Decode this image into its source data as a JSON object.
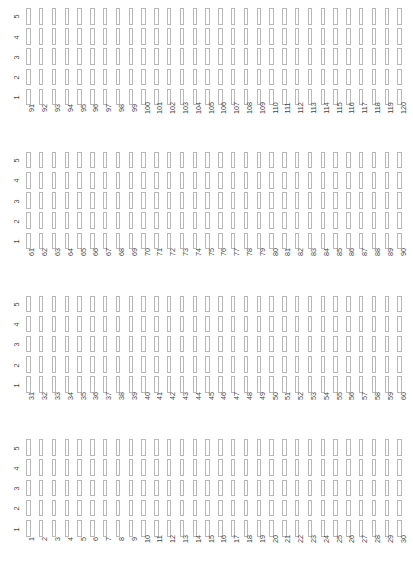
{
  "figure": {
    "type": "grid-matrix-panels",
    "background": "#ffffff",
    "cell_border_color": "#b8b8b8",
    "cell_fill_color": "#ffffff",
    "tick_label_color": "#444444",
    "panel_count": 4,
    "rows_per_panel": 5,
    "columns_per_panel": 30
  },
  "chart_data": {
    "type": "heatmap",
    "title": "",
    "xlabel": "",
    "ylabel": "",
    "grid": false,
    "legend": "none",
    "ylim": [
      1,
      5
    ],
    "y_categories": [
      "5",
      "4",
      "3",
      "2",
      "1"
    ],
    "panels": [
      {
        "index": 0,
        "y_ticks": [
          "5",
          "4",
          "3",
          "2",
          "1"
        ],
        "x_ticks": [
          "91",
          "92",
          "93",
          "94",
          "95",
          "96",
          "97",
          "98",
          "99",
          "100",
          "101",
          "102",
          "103",
          "104",
          "105",
          "106",
          "107",
          "108",
          "109",
          "110",
          "111",
          "112",
          "113",
          "114",
          "115",
          "116",
          "117",
          "118",
          "119",
          "120"
        ],
        "xlim": [
          91,
          120
        ],
        "values": [
          [
            0,
            0,
            0,
            0,
            0,
            0,
            0,
            0,
            0,
            0,
            0,
            0,
            0,
            0,
            0,
            0,
            0,
            0,
            0,
            0,
            0,
            0,
            0,
            0,
            0,
            0,
            0,
            0,
            0,
            0
          ],
          [
            0,
            0,
            0,
            0,
            0,
            0,
            0,
            0,
            0,
            0,
            0,
            0,
            0,
            0,
            0,
            0,
            0,
            0,
            0,
            0,
            0,
            0,
            0,
            0,
            0,
            0,
            0,
            0,
            0,
            0
          ],
          [
            0,
            0,
            0,
            0,
            0,
            0,
            0,
            0,
            0,
            0,
            0,
            0,
            0,
            0,
            0,
            0,
            0,
            0,
            0,
            0,
            0,
            0,
            0,
            0,
            0,
            0,
            0,
            0,
            0,
            0
          ],
          [
            0,
            0,
            0,
            0,
            0,
            0,
            0,
            0,
            0,
            0,
            0,
            0,
            0,
            0,
            0,
            0,
            0,
            0,
            0,
            0,
            0,
            0,
            0,
            0,
            0,
            0,
            0,
            0,
            0,
            0
          ],
          [
            0,
            0,
            0,
            0,
            0,
            0,
            0,
            0,
            0,
            0,
            0,
            0,
            0,
            0,
            0,
            0,
            0,
            0,
            0,
            0,
            0,
            0,
            0,
            0,
            0,
            0,
            0,
            0,
            0,
            0
          ]
        ]
      },
      {
        "index": 1,
        "y_ticks": [
          "5",
          "4",
          "3",
          "2",
          "1"
        ],
        "x_ticks": [
          "61",
          "62",
          "63",
          "64",
          "65",
          "66",
          "67",
          "68",
          "69",
          "70",
          "71",
          "72",
          "73",
          "74",
          "75",
          "76",
          "77",
          "78",
          "79",
          "80",
          "81",
          "82",
          "83",
          "84",
          "85",
          "86",
          "87",
          "88",
          "89",
          "90"
        ],
        "xlim": [
          61,
          90
        ],
        "values": [
          [
            0,
            0,
            0,
            0,
            0,
            0,
            0,
            0,
            0,
            0,
            0,
            0,
            0,
            0,
            0,
            0,
            0,
            0,
            0,
            0,
            0,
            0,
            0,
            0,
            0,
            0,
            0,
            0,
            0,
            0
          ],
          [
            0,
            0,
            0,
            0,
            0,
            0,
            0,
            0,
            0,
            0,
            0,
            0,
            0,
            0,
            0,
            0,
            0,
            0,
            0,
            0,
            0,
            0,
            0,
            0,
            0,
            0,
            0,
            0,
            0,
            0
          ],
          [
            0,
            0,
            0,
            0,
            0,
            0,
            0,
            0,
            0,
            0,
            0,
            0,
            0,
            0,
            0,
            0,
            0,
            0,
            0,
            0,
            0,
            0,
            0,
            0,
            0,
            0,
            0,
            0,
            0,
            0
          ],
          [
            0,
            0,
            0,
            0,
            0,
            0,
            0,
            0,
            0,
            0,
            0,
            0,
            0,
            0,
            0,
            0,
            0,
            0,
            0,
            0,
            0,
            0,
            0,
            0,
            0,
            0,
            0,
            0,
            0,
            0
          ],
          [
            0,
            0,
            0,
            0,
            0,
            0,
            0,
            0,
            0,
            0,
            0,
            0,
            0,
            0,
            0,
            0,
            0,
            0,
            0,
            0,
            0,
            0,
            0,
            0,
            0,
            0,
            0,
            0,
            0,
            0
          ]
        ]
      },
      {
        "index": 2,
        "y_ticks": [
          "5",
          "4",
          "3",
          "2",
          "1"
        ],
        "x_ticks": [
          "31",
          "32",
          "33",
          "34",
          "35",
          "36",
          "37",
          "38",
          "39",
          "40",
          "41",
          "42",
          "43",
          "44",
          "45",
          "46",
          "47",
          "48",
          "49",
          "50",
          "51",
          "52",
          "53",
          "54",
          "55",
          "56",
          "57",
          "58",
          "59",
          "60"
        ],
        "xlim": [
          31,
          60
        ],
        "values": [
          [
            0,
            0,
            0,
            0,
            0,
            0,
            0,
            0,
            0,
            0,
            0,
            0,
            0,
            0,
            0,
            0,
            0,
            0,
            0,
            0,
            0,
            0,
            0,
            0,
            0,
            0,
            0,
            0,
            0,
            0
          ],
          [
            0,
            0,
            0,
            0,
            0,
            0,
            0,
            0,
            0,
            0,
            0,
            0,
            0,
            0,
            0,
            0,
            0,
            0,
            0,
            0,
            0,
            0,
            0,
            0,
            0,
            0,
            0,
            0,
            0,
            0
          ],
          [
            0,
            0,
            0,
            0,
            0,
            0,
            0,
            0,
            0,
            0,
            0,
            0,
            0,
            0,
            0,
            0,
            0,
            0,
            0,
            0,
            0,
            0,
            0,
            0,
            0,
            0,
            0,
            0,
            0,
            0
          ],
          [
            0,
            0,
            0,
            0,
            0,
            0,
            0,
            0,
            0,
            0,
            0,
            0,
            0,
            0,
            0,
            0,
            0,
            0,
            0,
            0,
            0,
            0,
            0,
            0,
            0,
            0,
            0,
            0,
            0,
            0
          ],
          [
            0,
            0,
            0,
            0,
            0,
            0,
            0,
            0,
            0,
            0,
            0,
            0,
            0,
            0,
            0,
            0,
            0,
            0,
            0,
            0,
            0,
            0,
            0,
            0,
            0,
            0,
            0,
            0,
            0,
            0
          ]
        ]
      },
      {
        "index": 3,
        "y_ticks": [
          "5",
          "4",
          "3",
          "2",
          "1"
        ],
        "x_ticks": [
          "1",
          "2",
          "3",
          "4",
          "5",
          "6",
          "7",
          "8",
          "9",
          "10",
          "11",
          "12",
          "13",
          "14",
          "15",
          "16",
          "17",
          "18",
          "19",
          "20",
          "21",
          "22",
          "23",
          "24",
          "25",
          "26",
          "27",
          "28",
          "29",
          "30"
        ],
        "xlim": [
          1,
          30
        ],
        "values": [
          [
            0,
            0,
            0,
            0,
            0,
            0,
            0,
            0,
            0,
            0,
            0,
            0,
            0,
            0,
            0,
            0,
            0,
            0,
            0,
            0,
            0,
            0,
            0,
            0,
            0,
            0,
            0,
            0,
            0,
            0
          ],
          [
            0,
            0,
            0,
            0,
            0,
            0,
            0,
            0,
            0,
            0,
            0,
            0,
            0,
            0,
            0,
            0,
            0,
            0,
            0,
            0,
            0,
            0,
            0,
            0,
            0,
            0,
            0,
            0,
            0,
            0
          ],
          [
            0,
            0,
            0,
            0,
            0,
            0,
            0,
            0,
            0,
            0,
            0,
            0,
            0,
            0,
            0,
            0,
            0,
            0,
            0,
            0,
            0,
            0,
            0,
            0,
            0,
            0,
            0,
            0,
            0,
            0
          ],
          [
            0,
            0,
            0,
            0,
            0,
            0,
            0,
            0,
            0,
            0,
            0,
            0,
            0,
            0,
            0,
            0,
            0,
            0,
            0,
            0,
            0,
            0,
            0,
            0,
            0,
            0,
            0,
            0,
            0,
            0
          ],
          [
            0,
            0,
            0,
            0,
            0,
            0,
            0,
            0,
            0,
            0,
            0,
            0,
            0,
            0,
            0,
            0,
            0,
            0,
            0,
            0,
            0,
            0,
            0,
            0,
            0,
            0,
            0,
            0,
            0,
            0
          ]
        ]
      }
    ]
  }
}
